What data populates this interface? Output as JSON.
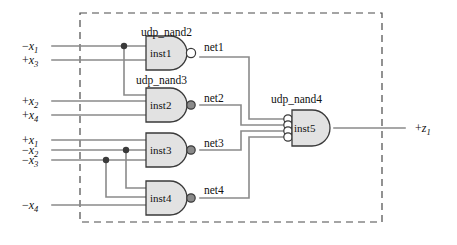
{
  "diagram": {
    "colors": {
      "wire": "#8a8a8a",
      "gate_fill": "#e2e2e2",
      "gate_stroke": "#3a3a3a",
      "border": "#4a4a4a",
      "text": "#111111",
      "bubble_open": "#ffffff",
      "bubble_filled": "#8a8a8a"
    },
    "module_border": {
      "style": "dashed",
      "x": 80,
      "y": 13,
      "width": 302,
      "height": 209
    },
    "inputs": [
      {
        "name": "input-x1-neg",
        "sign": "−",
        "var": "x",
        "index": "1",
        "y": 46
      },
      {
        "name": "input-x3-pos",
        "sign": "+",
        "var": "x",
        "index": "3",
        "y": 60
      },
      {
        "name": "input-x2-pos",
        "sign": "+",
        "var": "x",
        "index": "2",
        "y": 101
      },
      {
        "name": "input-x4-pos",
        "sign": "+",
        "var": "x",
        "index": "4",
        "y": 115
      },
      {
        "name": "input-x1-pos",
        "sign": "+",
        "var": "x",
        "index": "1",
        "y": 140
      },
      {
        "name": "input-x2-neg",
        "sign": "−",
        "var": "x",
        "index": "2",
        "y": 150
      },
      {
        "name": "input-x3-neg",
        "sign": "−",
        "var": "x",
        "index": "3",
        "y": 160
      },
      {
        "name": "input-x4-neg",
        "sign": "−",
        "var": "x",
        "index": "4",
        "y": 205
      }
    ],
    "output": {
      "name": "output-z1",
      "sign": "+",
      "var": "z",
      "index": "1",
      "y": 127
    },
    "gates": [
      {
        "id": "inst1",
        "label": "inst1",
        "type_label": "udp_nand2",
        "inputs": 2,
        "bubble": "open",
        "x": 145,
        "y": 40,
        "w": 48,
        "h": 34
      },
      {
        "id": "inst2",
        "label": "inst2",
        "type_label": "udp_nand3",
        "inputs": 3,
        "bubble": "filled",
        "x": 145,
        "y": 88,
        "w": 48,
        "h": 34
      },
      {
        "id": "inst3",
        "label": "inst3",
        "type_label": "",
        "inputs": 3,
        "bubble": "filled",
        "x": 145,
        "y": 133,
        "w": 48,
        "h": 34
      },
      {
        "id": "inst4",
        "label": "inst4",
        "type_label": "",
        "inputs": 3,
        "bubble": "filled",
        "x": 145,
        "y": 181,
        "w": 48,
        "h": 34
      },
      {
        "id": "inst5",
        "label": "inst5",
        "type_label": "udp_nand4",
        "inputs": 4,
        "bubble": "none",
        "x": 290,
        "y": 110,
        "w": 44,
        "h": 36
      }
    ],
    "nets": [
      {
        "name": "net1",
        "label": "net1",
        "x": 203,
        "y": 48
      },
      {
        "name": "net2",
        "label": "net2",
        "x": 203,
        "y": 99
      },
      {
        "name": "net3",
        "label": "net3",
        "x": 203,
        "y": 145
      },
      {
        "name": "net4",
        "label": "net4",
        "x": 203,
        "y": 192
      }
    ],
    "gate_type_labels": [
      {
        "name": "udp-nand2-label",
        "text": "udp_nand2",
        "x": 141,
        "y": 36
      },
      {
        "name": "udp-nand3-label",
        "text": "udp_nand3",
        "x": 136,
        "y": 84
      },
      {
        "name": "udp-nand4-label",
        "text": "udp_nand4",
        "x": 271,
        "y": 103
      }
    ],
    "junctions": [
      {
        "name": "junction-x1neg",
        "x": 124,
        "y": 46
      },
      {
        "name": "junction-x2neg",
        "x": 126,
        "y": 150
      },
      {
        "name": "junction-x3neg",
        "x": 106,
        "y": 160
      }
    ]
  }
}
